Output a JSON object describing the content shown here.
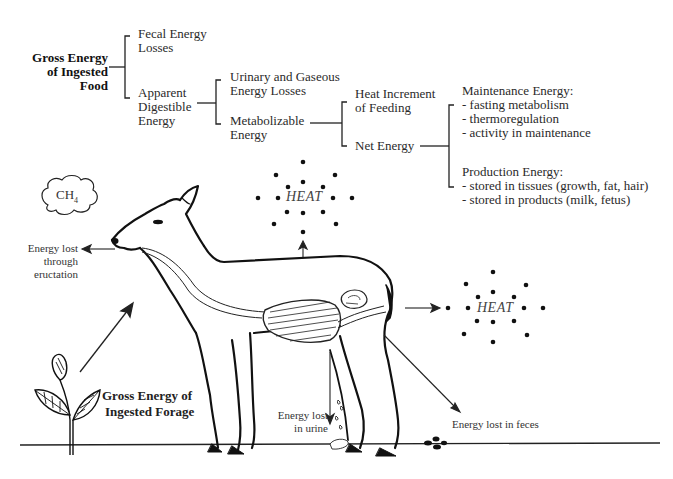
{
  "tree": {
    "root": {
      "line1": "Gross Energy",
      "line2": "of Ingested",
      "line3": "Food"
    },
    "fecal": {
      "line1": "Fecal Energy",
      "line2": "Losses"
    },
    "digestible": {
      "line1": "Apparent",
      "line2": "Digestible",
      "line3": "Energy"
    },
    "urinary": {
      "line1": "Urinary and Gaseous",
      "line2": "Energy Losses"
    },
    "metabolizable": {
      "line1": "Metabolizable",
      "line2": "Energy"
    },
    "heat_increment": {
      "line1": "Heat Increment",
      "line2": "of Feeding"
    },
    "net": {
      "line1": "Net Energy"
    },
    "maintenance": {
      "title": "Maintenance Energy:",
      "items": [
        "- fasting metabolism",
        "- thermoregulation",
        "- activity in maintenance"
      ]
    },
    "production": {
      "title": "Production Energy:",
      "items": [
        "- stored in tissues (growth, fat, hair)",
        "- stored in products (milk, fetus)"
      ]
    }
  },
  "illustration": {
    "gas_label": "CH",
    "gas_subscript": "4",
    "eructation": {
      "line1": "Energy lost",
      "line2": "through",
      "line3": "eructation"
    },
    "heat_top": "HEAT",
    "heat_right": "HEAT",
    "forage": {
      "line1": "Gross Energy of",
      "line2": "Ingested Forage"
    },
    "urine": {
      "line1": "Energy lost",
      "line2": "in urine"
    },
    "feces": "Energy lost in feces"
  }
}
